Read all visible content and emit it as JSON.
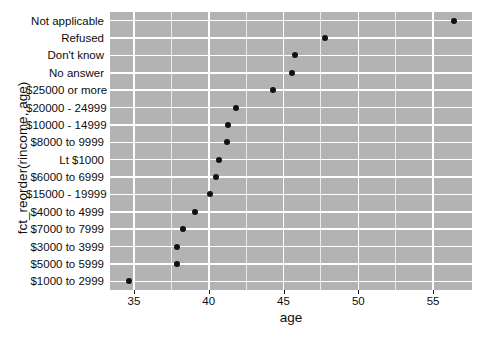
{
  "chart_data": {
    "type": "scatter",
    "title": "",
    "xlabel": "age",
    "ylabel": "fct_reorder(rincome, age)",
    "xlim": [
      33.4,
      57.6
    ],
    "grid": true,
    "legend": "none",
    "x_ticks": [
      35,
      40,
      45,
      50,
      55
    ],
    "x_tick_labels": [
      "35",
      "40",
      "45",
      "50",
      "55"
    ],
    "x_minor_ticks": [
      37.5,
      42.5,
      47.5,
      52.5
    ],
    "categories": [
      "Not applicable",
      "Refused",
      "Don't know",
      "No answer",
      "$25000 or more",
      "$20000 - 24999",
      "$10000 - 14999",
      "$8000 to 9999",
      "Lt $1000",
      "$6000 to 6999",
      "$15000 - 19999",
      "$4000 to 4999",
      "$7000 to 7999",
      "$3000 to 3999",
      "$5000 to 5999",
      "$1000 to 2999"
    ],
    "values": [
      56.4,
      47.8,
      45.8,
      45.6,
      44.3,
      41.8,
      41.3,
      41.2,
      40.7,
      40.5,
      40.1,
      39.1,
      38.3,
      37.9,
      37.9,
      34.7
    ],
    "points": [
      {
        "label": "Not applicable",
        "age": 56.4
      },
      {
        "label": "Refused",
        "age": 47.8
      },
      {
        "label": "Don't know",
        "age": 45.8
      },
      {
        "label": "No answer",
        "age": 45.6
      },
      {
        "label": "$25000 or more",
        "age": 44.3
      },
      {
        "label": "$20000 - 24999",
        "age": 41.8
      },
      {
        "label": "$10000 - 14999",
        "age": 41.3
      },
      {
        "label": "$8000 to 9999",
        "age": 41.2
      },
      {
        "label": "Lt $1000",
        "age": 40.7
      },
      {
        "label": "$6000 to 6999",
        "age": 40.5
      },
      {
        "label": "$15000 - 19999",
        "age": 40.1
      },
      {
        "label": "$4000 to 4999",
        "age": 39.1
      },
      {
        "label": "$7000 to 7999",
        "age": 38.3
      },
      {
        "label": "$3000 to 3999",
        "age": 37.9
      },
      {
        "label": "$5000 to 5999",
        "age": 37.9
      },
      {
        "label": "$1000 to 2999",
        "age": 34.7
      }
    ],
    "colors": {
      "panel_background": "#b3b3b3",
      "gridline": "#ffffff",
      "point": "#111111",
      "text": "#0d0d0d",
      "page_background": "#ffffff"
    }
  }
}
